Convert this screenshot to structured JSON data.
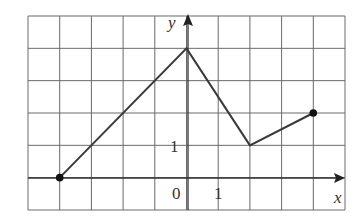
{
  "chart_data": {
    "type": "line",
    "title": "",
    "xlabel": "x",
    "ylabel": "y",
    "xlim": [
      -5,
      5
    ],
    "ylim": [
      -1,
      5
    ],
    "grid": true,
    "tick_labels": {
      "x": [
        "0",
        "1"
      ],
      "y": [
        "1"
      ]
    },
    "series": [
      {
        "name": "f",
        "x": [
          -4,
          0,
          2,
          4
        ],
        "y": [
          0,
          4,
          1,
          2
        ],
        "endpoints": "closed"
      }
    ]
  },
  "labels": {
    "x_axis": "x",
    "y_axis": "y",
    "origin": "0",
    "x_tick_1": "1",
    "y_tick_1": "1"
  },
  "colors": {
    "line": "#3a3a3a",
    "grid": "#6a6a6a",
    "dot": "#111111"
  }
}
